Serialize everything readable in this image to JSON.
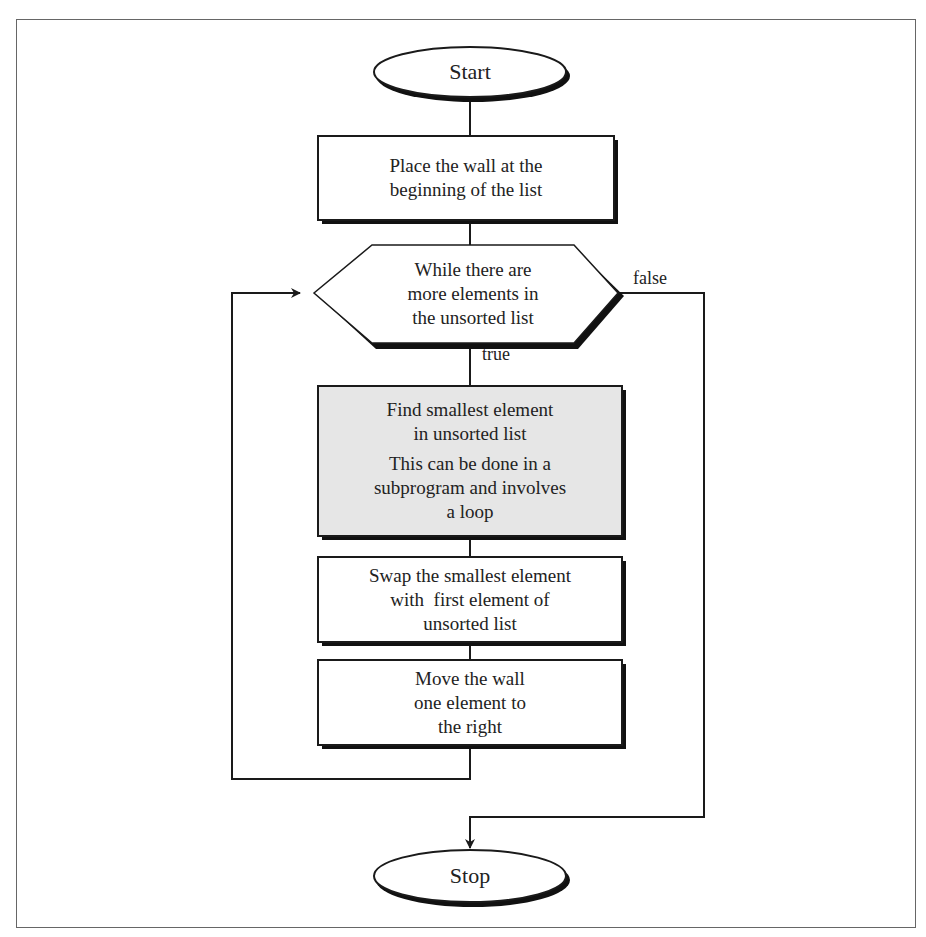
{
  "diagram": {
    "type": "flowchart",
    "colors": {
      "stroke": "#1a1a1a",
      "shadow": "#111111",
      "process_fill": "#ffffff",
      "highlight_fill": "#e6e6e6",
      "frame": "#666666"
    },
    "nodes": {
      "start": {
        "shape": "terminal",
        "text": "Start"
      },
      "place_wall": {
        "shape": "process",
        "lines": [
          "Place the wall at the",
          "beginning of the list"
        ]
      },
      "while_loop": {
        "shape": "decision-hexagon",
        "lines": [
          "While there are",
          "more elements in",
          "the unsorted list"
        ]
      },
      "find_smallest": {
        "shape": "process-highlighted",
        "lines": [
          "Find smallest element",
          "in unsorted list"
        ],
        "note_lines": [
          "This can be done in a",
          "subprogram and involves",
          "a loop"
        ]
      },
      "swap": {
        "shape": "process",
        "lines": [
          "Swap the smallest element",
          "with  first element of",
          "unsorted list"
        ]
      },
      "move_wall": {
        "shape": "process",
        "lines": [
          "Move the wall",
          "one element to",
          "the right"
        ]
      },
      "stop": {
        "shape": "terminal",
        "text": "Stop"
      }
    },
    "edges": [
      {
        "from": "start",
        "to": "place_wall",
        "label": ""
      },
      {
        "from": "place_wall",
        "to": "while_loop",
        "label": ""
      },
      {
        "from": "while_loop",
        "to": "find_smallest",
        "label": "true"
      },
      {
        "from": "find_smallest",
        "to": "swap",
        "label": ""
      },
      {
        "from": "swap",
        "to": "move_wall",
        "label": ""
      },
      {
        "from": "move_wall",
        "to": "while_loop",
        "label": ""
      },
      {
        "from": "while_loop",
        "to": "stop",
        "label": "false"
      }
    ],
    "edge_labels": {
      "true": "true",
      "false": "false"
    }
  }
}
